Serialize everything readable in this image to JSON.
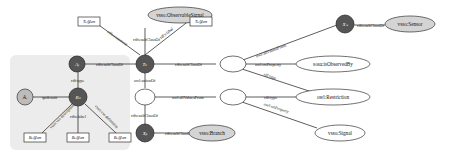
{
  "diagram": {
    "type": "ontology-graph",
    "colors": {
      "group_background": "#ececec",
      "instance_node": "#555555",
      "class_node_fill": "#d9d9d9",
      "blank_node_fill": "#ffffff",
      "attribute_node_fill": "#bcbcbc",
      "edge": "#333333"
    },
    "nodes": {
      "vsso_observable_signal": "vsso:ObservableSignal",
      "vsso_sensor": "vsso:Sensor",
      "sosa_is_observed_by": "sosa:isObservedBy",
      "owl_restriction": "owl:Restriction",
      "vsso_signal": "vsso:Signal",
      "vsso_branch": "vsso:Branch",
      "t_k": "Tₖ",
      "a_j": "Aⱼ",
      "b_k": "Bₖ",
      "a_r": "Aᵣ",
      "x_s": "Xₛ",
      "x_b": "Xᵦ",
      "t_k_unit_box": "Tₖ@en",
      "t_k_label_box": "Tₖ@en",
      "b_k_box_1": "Bₖ@en",
      "b_k_box_2": "Bₖ@en",
      "b_k_box_3": "Bₖ@en"
    },
    "edges": {
      "tk_unit_comment": "rdfs:comment",
      "tk_label": "rdfs:label",
      "tk_subclass_observable": "rdfs:subClassOf",
      "aj_subclass_tk": "rdfs:subClassOf",
      "tk_subclass_restriction": "rdfs:subClassOf",
      "aj_rdftype_bk": "rdf:type",
      "ar_qudt_unit": "qudt:unit",
      "bk_comment_1": "vsso:vss descriptions",
      "bk_label": "rdfs:label",
      "bk_comment_2": "vsso:vss definition",
      "tk_union_of": "owl:unionOf",
      "blank_subclass_xb": "rdfs:subClassOf",
      "xb_subclass_branch": "rdfs:subClassOf",
      "union_all_values": "owl:allValuesFrom",
      "restr_all_values_xs": "owl:allValuesFrom",
      "xs_subclass_sensor": "rdfs:subClassOf",
      "restr_on_property_observed": "owl:onProperty",
      "restr_rdftype": "rdf:type",
      "restr2_rdftype": "rdf:type",
      "restr2_on_property_signal": "owl:onProperty"
    }
  }
}
